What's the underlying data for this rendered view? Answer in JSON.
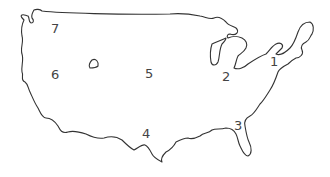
{
  "map": {
    "title": "United States outline with numbered regions",
    "outline_color": "#333333",
    "label_color": "#444444",
    "background": "#ffffff",
    "labels": [
      {
        "id": "1",
        "text": "1",
        "x": 270,
        "y": 55
      },
      {
        "id": "2",
        "text": "2",
        "x": 222,
        "y": 70
      },
      {
        "id": "3",
        "text": "3",
        "x": 234,
        "y": 119
      },
      {
        "id": "4",
        "text": "4",
        "x": 142,
        "y": 127
      },
      {
        "id": "5",
        "text": "5",
        "x": 145,
        "y": 67
      },
      {
        "id": "6",
        "text": "6",
        "x": 51,
        "y": 68
      },
      {
        "id": "7",
        "text": "7",
        "x": 51,
        "y": 22
      }
    ]
  }
}
